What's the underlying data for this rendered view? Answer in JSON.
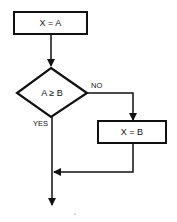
{
  "diagram": {
    "type": "flowchart",
    "nodes": [
      {
        "id": "assign_a",
        "shape": "process",
        "label": "X = A"
      },
      {
        "id": "compare",
        "shape": "decision",
        "label": "A ≥ B"
      },
      {
        "id": "assign_b",
        "shape": "process",
        "label": "X = B"
      }
    ],
    "edges": [
      {
        "from": "assign_a",
        "to": "compare",
        "label": ""
      },
      {
        "from": "compare",
        "to": "assign_b",
        "label": "NO"
      },
      {
        "from": "compare",
        "to": "exit",
        "label": "YES"
      },
      {
        "from": "assign_b",
        "to": "exit",
        "label": ""
      }
    ],
    "labels": {
      "box1": "X = A",
      "decision": "A ≥ B",
      "box2": "X = B",
      "no": "NO",
      "yes": "YES"
    },
    "colors": {
      "stroke": "#111111",
      "background": "#ffffff"
    }
  }
}
